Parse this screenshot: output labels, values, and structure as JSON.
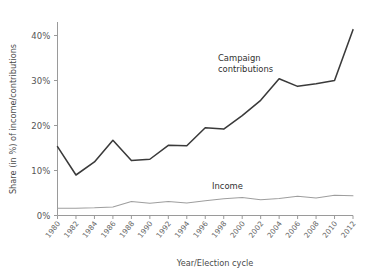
{
  "chart_data": {
    "type": "line",
    "title": "",
    "xlabel": "Year/Election cycle",
    "ylabel": "Share (in %) of income/contributions",
    "categories": [
      "1980",
      "1982",
      "1984",
      "1986",
      "1988",
      "1990",
      "1992",
      "1994",
      "1996",
      "1998",
      "2000",
      "2002",
      "2004",
      "2006",
      "2008",
      "2010",
      "2012"
    ],
    "x": [
      1980,
      1982,
      1984,
      1986,
      1988,
      1990,
      1992,
      1994,
      1996,
      1998,
      2000,
      2002,
      2004,
      2006,
      2008,
      2010,
      2012
    ],
    "ylim": [
      0,
      43
    ],
    "xlim": [
      1980,
      2012
    ],
    "ytick_labels": [
      "0%",
      "10%",
      "20%",
      "30%",
      "40%"
    ],
    "ytick_values": [
      0,
      10,
      20,
      30,
      40
    ],
    "grid": false,
    "legend_position": "inline-annotation",
    "series": [
      {
        "name": "Campaign contributions",
        "color": "#3a3a3a",
        "values": [
          15.3,
          9.0,
          11.9,
          16.7,
          12.2,
          12.5,
          15.6,
          15.5,
          19.5,
          19.2,
          22.2,
          25.6,
          30.4,
          28.7,
          29.3,
          30.0,
          41.3
        ]
      },
      {
        "name": "Income",
        "color": "#9e9e9e",
        "values": [
          1.6,
          1.6,
          1.7,
          1.9,
          3.1,
          2.7,
          3.1,
          2.8,
          3.3,
          3.7,
          4.0,
          3.5,
          3.8,
          4.3,
          3.9,
          4.5,
          4.4
        ]
      }
    ],
    "annotations": [
      {
        "name": "Campaign contributions",
        "lines": [
          "Campaign",
          "contributions"
        ],
        "x": 218,
        "y": 61
      },
      {
        "name": "Income",
        "lines": [
          "Income"
        ],
        "x": 212,
        "y": 189
      }
    ]
  },
  "axes": {
    "y_axis_title": "Share (in %) of income/contributions",
    "x_axis_title": "Year/Election cycle"
  },
  "colors": {
    "campaign_line": "#3a3a3a",
    "income_line": "#9e9e9e",
    "axis": "#9a9a9a",
    "background": "#ffffff",
    "text": "#4a4a4a"
  }
}
